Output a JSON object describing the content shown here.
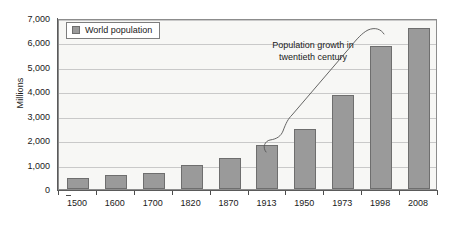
{
  "chart_data": {
    "type": "bar",
    "title": "",
    "subtitle": "",
    "xlabel": "",
    "ylabel": "Millions",
    "ylim": [
      0,
      7000
    ],
    "ytick_labels": [
      "0",
      "1,000",
      "2,000",
      "3,000",
      "4,000",
      "5,000",
      "6,000",
      "7,000"
    ],
    "ytick_values": [
      0,
      1000,
      2000,
      3000,
      4000,
      5000,
      6000,
      7000
    ],
    "grid": true,
    "legend_position": "top-left",
    "legend": [
      "World population"
    ],
    "categories": [
      "1500",
      "1600",
      "1700",
      "1820",
      "1870",
      "1913",
      "1950",
      "1973",
      "1998",
      "2008"
    ],
    "series": [
      {
        "name": "World population",
        "color": "#9a9a9a",
        "values": [
          450,
          580,
          650,
          970,
          1270,
          1790,
          2450,
          3830,
          5850,
          6600
        ]
      }
    ],
    "annotations": [
      {
        "name": "population-growth-annotation",
        "lines": [
          "Population growth in",
          "twentieth century"
        ],
        "text": "Population growth in twentieth century"
      }
    ]
  },
  "legend": {
    "swatch_icon": "square-swatch-icon",
    "label": "World population"
  },
  "axes": {
    "y_title": "Millions"
  },
  "annotation": {
    "line1": "Population growth in",
    "line2": "twentieth century"
  },
  "colors": {
    "bar_fill": "#9a9a9a",
    "bar_stroke": "#6e6e6e",
    "plot_background": "#f7f7f5",
    "gridline": "#c9c9c9",
    "plot_border": "#8c8c8c",
    "text": "#1a1a1a",
    "page_background": "#ffffff"
  }
}
